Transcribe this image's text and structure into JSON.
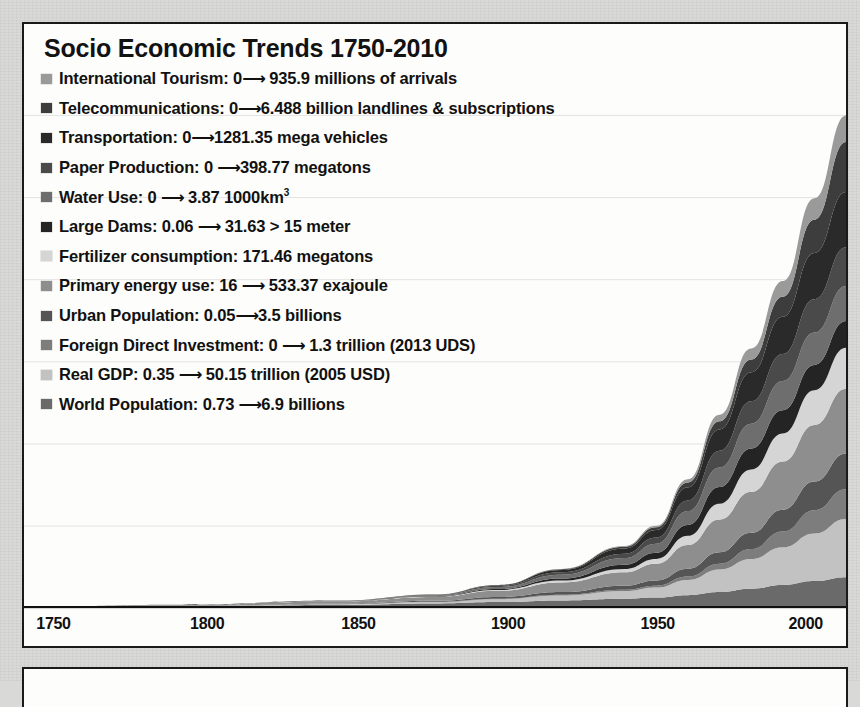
{
  "page": {
    "background_color": "#d9d9d7",
    "panel_background": "#fdfdfb",
    "border_color": "#1a1a1a"
  },
  "chart_title": "Socio Economic Trends 1750-2010",
  "legend": [
    {
      "label": "International Tourism: 0⟶ 935.9 millions of arrivals",
      "color": "#9a9a9a",
      "key": "international-tourism"
    },
    {
      "label": "Telecommunications: 0⟶6.488 billion landlines & subscriptions",
      "color": "#3d3d3d",
      "key": "telecommunications"
    },
    {
      "label": "Transportation: 0⟶1281.35 mega vehicles",
      "color": "#2a2a2a",
      "key": "transportation"
    },
    {
      "label": "Paper Production: 0 ⟶398.77 megatons",
      "color": "#4a4a4a",
      "key": "paper-production"
    },
    {
      "label": "Water Use: 0 ⟶ 3.87 1000km³",
      "color": "#6e6e6e",
      "key": "water-use"
    },
    {
      "label": "Large Dams: 0.06 ⟶ 31.63 > 15 meter",
      "color": "#242424",
      "key": "large-dams"
    },
    {
      "label": "Fertilizer consumption: 171.46 megatons",
      "color": "#d5d5d5",
      "key": "fertilizer-consumption"
    },
    {
      "label": "Primary energy use: 16 ⟶ 533.37 exajoule",
      "color": "#8e8e8e",
      "key": "primary-energy-use"
    },
    {
      "label": "Urban Population: 0.05⟶3.5 billions",
      "color": "#555555",
      "key": "urban-population"
    },
    {
      "label": "Foreign Direct Investment: 0 ⟶ 1.3 trillion (2013 UDS)",
      "color": "#7d7d7d",
      "key": "foreign-direct-investment"
    },
    {
      "label": "Real GDP: 0.35 ⟶ 50.15 trillion (2005 USD)",
      "color": "#c2c2c2",
      "key": "real-gdp"
    },
    {
      "label": "World Population: 0.73 ⟶6.9 billions",
      "color": "#6a6a6a",
      "key": "world-population"
    }
  ],
  "axis": {
    "x_ticks": [
      "1750",
      "1800",
      "1850",
      "1900",
      "1950",
      "2000"
    ],
    "x_tick_positions_pct": [
      1.5,
      20.2,
      38.6,
      56.8,
      75.0,
      93.0
    ],
    "y_gridline_count": 6
  },
  "chart_data": {
    "type": "area",
    "stacked": true,
    "title": "Socio Economic Trends 1750-2010",
    "xlabel": "",
    "ylabel": "",
    "xlim": [
      1750,
      2010
    ],
    "grid": true,
    "legend_position": "top-left",
    "x": [
      1750,
      1800,
      1850,
      1880,
      1900,
      1920,
      1940,
      1950,
      1960,
      1970,
      1980,
      1990,
      2000,
      2010
    ],
    "series": [
      {
        "name": "World Population",
        "color": "#6a6a6a",
        "units": "billions",
        "start": 0.73,
        "end": 6.9,
        "values": [
          0.05,
          0.08,
          0.14,
          0.2,
          0.26,
          0.33,
          0.4,
          0.45,
          0.55,
          0.68,
          0.82,
          0.98,
          1.14,
          1.3
        ]
      },
      {
        "name": "Real GDP",
        "color": "#c2c2c2",
        "units": "trillion (2005 USD)",
        "start": 0.35,
        "end": 50.15,
        "values": [
          0.0,
          0.01,
          0.03,
          0.06,
          0.12,
          0.2,
          0.32,
          0.42,
          0.64,
          0.95,
          1.25,
          1.58,
          2.0,
          2.45
        ]
      },
      {
        "name": "Foreign Direct Investment",
        "color": "#7d7d7d",
        "units": "trillion (2013 UDS)",
        "start": 0.0,
        "end": 1.3,
        "values": [
          0.0,
          0.0,
          0.0,
          0.01,
          0.02,
          0.04,
          0.06,
          0.08,
          0.14,
          0.24,
          0.42,
          0.66,
          0.98,
          1.25
        ]
      },
      {
        "name": "Urban Population",
        "color": "#555555",
        "units": "billions",
        "start": 0.05,
        "end": 3.5,
        "values": [
          0.0,
          0.01,
          0.02,
          0.04,
          0.07,
          0.11,
          0.17,
          0.22,
          0.33,
          0.48,
          0.68,
          0.92,
          1.2,
          1.5
        ]
      },
      {
        "name": "Primary energy use",
        "color": "#8e8e8e",
        "units": "exajoule",
        "start": 16,
        "end": 533.37,
        "values": [
          0.02,
          0.04,
          0.09,
          0.16,
          0.26,
          0.4,
          0.56,
          0.7,
          1.0,
          1.38,
          1.72,
          2.02,
          2.38,
          2.72
        ]
      },
      {
        "name": "Fertilizer consumption",
        "color": "#d5d5d5",
        "units": "megatons",
        "start": 0.0,
        "end": 171.46,
        "values": [
          0.0,
          0.0,
          0.01,
          0.02,
          0.04,
          0.08,
          0.14,
          0.2,
          0.38,
          0.66,
          0.94,
          1.18,
          1.46,
          1.72
        ]
      },
      {
        "name": "Large Dams",
        "color": "#242424",
        "units": "> 15 meter",
        "start": 0.06,
        "end": 31.63,
        "values": [
          0.0,
          0.0,
          0.01,
          0.02,
          0.04,
          0.09,
          0.18,
          0.26,
          0.46,
          0.7,
          0.88,
          0.98,
          1.06,
          1.12
        ]
      },
      {
        "name": "Water Use",
        "color": "#6e6e6e",
        "units": "1000km³",
        "start": 0.0,
        "end": 3.87,
        "values": [
          0.0,
          0.01,
          0.02,
          0.04,
          0.08,
          0.16,
          0.28,
          0.38,
          0.58,
          0.82,
          1.04,
          1.22,
          1.36,
          1.48
        ]
      },
      {
        "name": "Paper Production",
        "color": "#4a4a4a",
        "units": "megatons",
        "start": 0.0,
        "end": 398.77,
        "values": [
          0.0,
          0.0,
          0.01,
          0.02,
          0.05,
          0.1,
          0.18,
          0.26,
          0.44,
          0.7,
          0.94,
          1.14,
          1.4,
          1.62
        ]
      },
      {
        "name": "Transportation",
        "color": "#2a2a2a",
        "units": "mega vehicles",
        "start": 0.0,
        "end": 1281.35,
        "values": [
          0.0,
          0.0,
          0.0,
          0.01,
          0.03,
          0.1,
          0.22,
          0.32,
          0.56,
          0.9,
          1.22,
          1.56,
          1.94,
          2.32
        ]
      },
      {
        "name": "Telecommunications",
        "color": "#3d3d3d",
        "units": "billion landlines & subscriptions",
        "start": 0.0,
        "end": 6.488,
        "values": [
          0.0,
          0.0,
          0.0,
          0.0,
          0.01,
          0.03,
          0.07,
          0.11,
          0.2,
          0.34,
          0.54,
          0.84,
          1.4,
          2.1
        ]
      },
      {
        "name": "International Tourism",
        "color": "#9a9a9a",
        "units": "millions of arrivals",
        "start": 0.0,
        "end": 935.9,
        "values": [
          0.0,
          0.0,
          0.0,
          0.0,
          0.0,
          0.01,
          0.03,
          0.06,
          0.14,
          0.28,
          0.46,
          0.66,
          0.9,
          1.12
        ]
      }
    ]
  }
}
